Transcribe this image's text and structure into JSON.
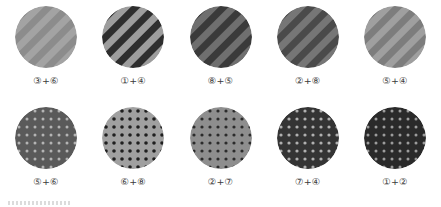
{
  "page": {
    "background": "#ffffff",
    "rows": 2,
    "columns": 5,
    "total_swatches": 10
  },
  "swatches": [
    {
      "label": "③+⑥",
      "pattern": "diagonal-stripes",
      "base_color": "#8c8c8c",
      "stripe_color": "#a3a3a3",
      "stripe_width": 5,
      "stripe_angle": 45,
      "contrast": "low"
    },
    {
      "label": "①+④",
      "pattern": "diagonal-stripes",
      "base_color": "#2e2e2e",
      "stripe_color": "#9d9d9d",
      "stripe_width": 5,
      "stripe_angle": 45,
      "contrast": "high"
    },
    {
      "label": "⑧+⑤",
      "pattern": "diagonal-stripes",
      "base_color": "#3a3a3a",
      "stripe_color": "#6f6f6f",
      "stripe_width": 5,
      "stripe_angle": 45,
      "contrast": "medium"
    },
    {
      "label": "②+⑧",
      "pattern": "diagonal-stripes",
      "base_color": "#4a4a4a",
      "stripe_color": "#767676",
      "stripe_width": 5,
      "stripe_angle": 45,
      "contrast": "medium"
    },
    {
      "label": "⑤+④",
      "pattern": "diagonal-stripes",
      "base_color": "#7d7d7d",
      "stripe_color": "#9f9f9f",
      "stripe_width": 5,
      "stripe_angle": 45,
      "contrast": "low"
    },
    {
      "label": "⑤+⑥",
      "pattern": "dots",
      "base_color": "#5a5a5a",
      "dot_color": "#b4b4b4",
      "dot_radius": 1.5,
      "dot_spacing": 8,
      "contrast": "medium"
    },
    {
      "label": "⑥+⑧",
      "pattern": "dots",
      "base_color": "#a0a0a0",
      "dot_color": "#1f1f1f",
      "dot_radius": 1.8,
      "dot_spacing": 8,
      "contrast": "high"
    },
    {
      "label": "②+⑦",
      "pattern": "dots",
      "base_color": "#8e8e8e",
      "dot_color": "#2b2b2b",
      "dot_radius": 1.6,
      "dot_spacing": 8,
      "contrast": "medium"
    },
    {
      "label": "⑦+④",
      "pattern": "dots",
      "base_color": "#343434",
      "dot_color": "#b0b0b0",
      "dot_radius": 1.6,
      "dot_spacing": 8,
      "contrast": "medium"
    },
    {
      "label": "①+②",
      "pattern": "dots",
      "base_color": "#2a2a2a",
      "dot_color": "#9c9c9c",
      "dot_radius": 1.5,
      "dot_spacing": 8,
      "contrast": "medium"
    }
  ]
}
